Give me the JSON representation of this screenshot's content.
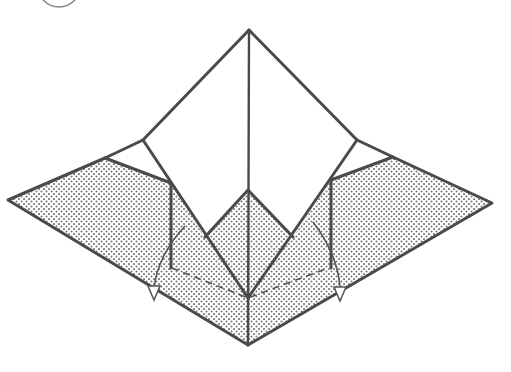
{
  "diagram": {
    "type": "origami-step",
    "step_number_visible": "",
    "colors": {
      "line": "#4a4a4a",
      "shade_dot": "#7a7a7a",
      "paper_white": "#ffffff",
      "background": "#ffffff"
    },
    "elements": {
      "top_flap": {
        "label": "upper white kite flap"
      },
      "left_wing": {
        "label": "left shaded wing"
      },
      "right_wing": {
        "label": "right shaded wing"
      },
      "center_diamond": {
        "label": "center shaded diamond"
      },
      "bottom_point": {
        "label": "lower shaded point"
      },
      "left_arrow": {
        "label": "fold-down arrow (left)"
      },
      "right_arrow": {
        "label": "fold-down arrow (right)"
      },
      "valley_fold_line": {
        "label": "dashed valley fold line"
      }
    }
  }
}
